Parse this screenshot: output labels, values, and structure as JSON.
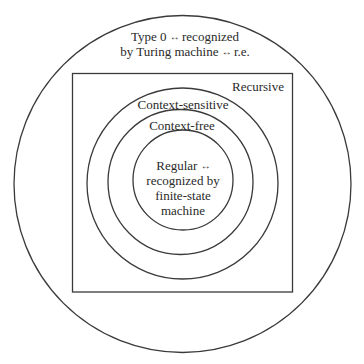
{
  "diagram": {
    "stroke_color": "#3a3a3a",
    "text_color": "#2a2a2a",
    "background": "#ffffff",
    "arrow_glyph": "↔",
    "regions": [
      {
        "id": "type0",
        "shape": "circle",
        "line1_a": "Type 0",
        "line1_b": "recognized",
        "line2_a": "by Turing machine",
        "line2_b": "r.e."
      },
      {
        "id": "recursive",
        "shape": "rectangle",
        "label": "Recursive"
      },
      {
        "id": "context-sensitive",
        "shape": "circle",
        "label": "Context-sensitive"
      },
      {
        "id": "context-free",
        "shape": "circle",
        "label": "Context-free"
      },
      {
        "id": "regular",
        "shape": "circle",
        "line1": "Regular",
        "line2": "recognized by",
        "line3": "finite-state",
        "line4": "machine"
      }
    ]
  }
}
